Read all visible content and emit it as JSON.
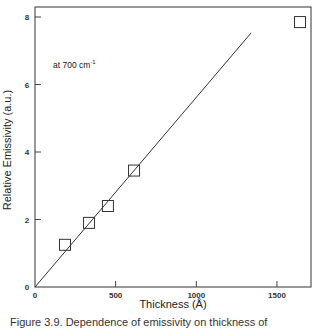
{
  "chart_data": {
    "type": "scatter",
    "title": "",
    "xlabel": "Thickness (Å)",
    "ylabel": "Relative Emissivity (a.u.)",
    "xlim": [
      0,
      1700
    ],
    "ylim": [
      0,
      8.3
    ],
    "x_ticks": [
      0,
      500,
      1000,
      1500
    ],
    "x_tick_labels": [
      "0",
      "500",
      "1000",
      "1500"
    ],
    "y_ticks": [
      0,
      2,
      4,
      6,
      8
    ],
    "y_tick_labels": [
      "0",
      "2",
      "4",
      "6",
      "8"
    ],
    "grid": false,
    "legend": null,
    "annotations": [
      {
        "text": "at 700 cm",
        "superscript": "-1",
        "x": 40,
        "y": 7.0
      }
    ],
    "series": [
      {
        "name": "measured",
        "marker": "open-square",
        "x": [
          186,
          335,
          452,
          614,
          1643
        ],
        "y": [
          1.25,
          1.9,
          2.4,
          3.45,
          7.85
        ]
      },
      {
        "name": "linear fit",
        "style": "line",
        "x": [
          0,
          1340
        ],
        "y": [
          0,
          7.53
        ]
      }
    ]
  },
  "labels": {
    "xlabel": "Thickness (Å)",
    "ylabel": "Relative Emissivity (a.u.)",
    "annotation": "at 700 cm",
    "annotation_sup": "-1",
    "caption": "Figure 3.9. Dependence of emissivity on thickness of"
  },
  "plot_area": {
    "left": 35,
    "top": 7,
    "right": 311,
    "bottom": 287,
    "x_scale": 0.1613,
    "y_scale": 33.75
  }
}
